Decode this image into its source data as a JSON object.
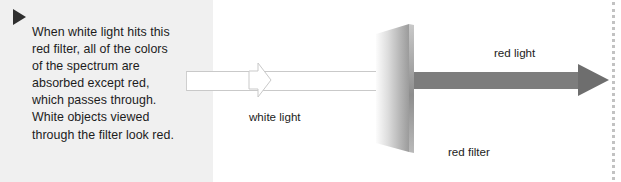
{
  "figure": {
    "background_color": "#ffffff",
    "caption_panel": {
      "background_color": "#f0f0f0",
      "marker_icon": "play-triangle-icon",
      "lines": [
        "When white light hits this",
        "red filter, all of the colors",
        "of the spectrum are",
        "absorbed except red,",
        "which passes through.",
        "White objects viewed",
        "through the filter look red."
      ],
      "full_text": "When white light hits this red filter, all of the colors of the spectrum are absorbed except red, which passes through. White objects viewed through the filter look red."
    },
    "diagram": {
      "labels": {
        "white_light": "white light",
        "red_light": "red light",
        "red_filter": "red filter"
      },
      "white_beam": {
        "name": "white-light-beam",
        "fill_color": "#ffffff",
        "outline_color": "#c9c9c9"
      },
      "filter_panel": {
        "name": "red-filter-panel",
        "gradient_from": "#fbfbfb",
        "gradient_to": "#9a9a9a",
        "edge_color": "#8a8a8a"
      },
      "red_beam": {
        "name": "red-light-beam",
        "fill_color": "#7d7d7d",
        "arrowhead_color": "#6e6e6e"
      },
      "divider": {
        "name": "dotted-divider",
        "color": "#c2c2c2",
        "style": "dotted"
      }
    }
  }
}
